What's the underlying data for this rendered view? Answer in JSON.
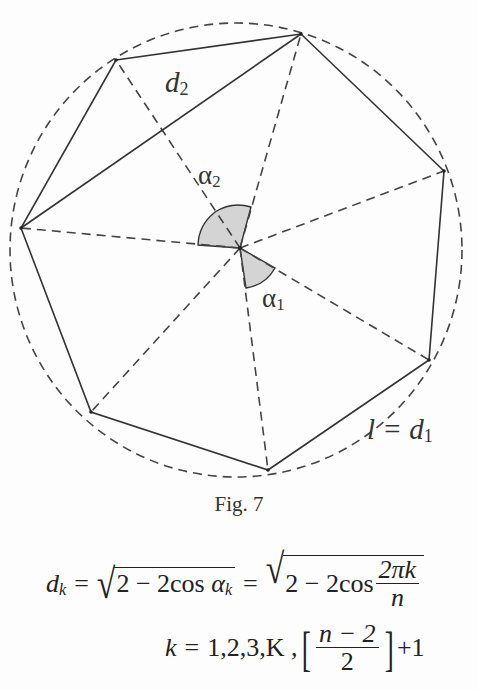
{
  "figure": {
    "caption": "Fig. 7",
    "center": {
      "x": 240,
      "y": 248
    },
    "circle": {
      "cx": 236,
      "cy": 249,
      "r": 226
    },
    "vertices": [
      {
        "id": "v1",
        "x": 116,
        "y": 60
      },
      {
        "id": "v2",
        "x": 301,
        "y": 34
      },
      {
        "id": "v3",
        "x": 444,
        "y": 171
      },
      {
        "id": "v4",
        "x": 429,
        "y": 360
      },
      {
        "id": "v5",
        "x": 268,
        "y": 470
      },
      {
        "id": "v6",
        "x": 91,
        "y": 412
      },
      {
        "id": "v7",
        "x": 21,
        "y": 228
      }
    ],
    "labels": {
      "d2": {
        "base": "d",
        "sub": "2"
      },
      "alpha2": {
        "base": "α",
        "sub": "2"
      },
      "alpha1": {
        "base": "α",
        "sub": "1"
      },
      "l_eq_d1": {
        "base": "l = d",
        "sub": "1"
      }
    }
  },
  "equations": {
    "eq1": {
      "lhs": "d",
      "lhs_sub": "k",
      "eq": "=",
      "rad1": "2 − 2cos",
      "rad1_var": "α",
      "rad1_sub": "k",
      "rad2": "2 − 2cos",
      "frac_num": "2πk",
      "frac_den": "n"
    },
    "eq2": {
      "var": "k",
      "eq": "=",
      "list": "1,2,3,K ,",
      "frac_num": "n − 2",
      "frac_den": "2",
      "tail": "+1"
    }
  }
}
